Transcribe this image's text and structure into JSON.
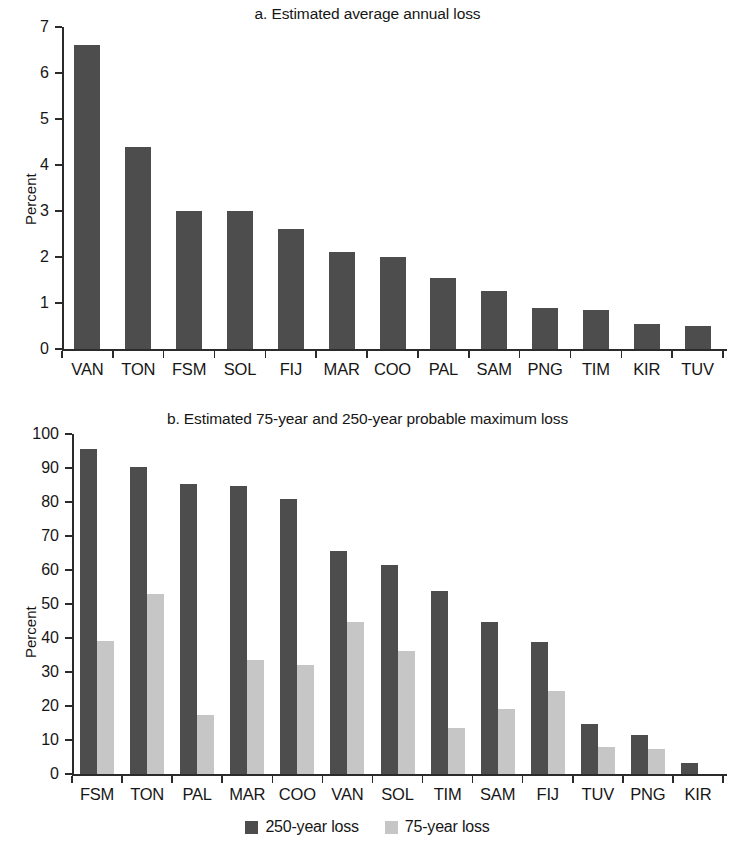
{
  "figure": {
    "ylabel": "Percent",
    "series_colors": {
      "primary": "#4d4d4d",
      "secondary": "#c6c6c6"
    },
    "axis_color": "#2b2b2b"
  },
  "legend": {
    "items": [
      {
        "label": "250-year loss",
        "color": "#4d4d4d"
      },
      {
        "label": "75-year loss",
        "color": "#c6c6c6"
      }
    ]
  },
  "chart_data": [
    {
      "type": "bar",
      "panel": "a",
      "title": "a. Estimated average annual loss",
      "xlabel": "",
      "ylabel": "Percent",
      "ylim": [
        0,
        7
      ],
      "yticks": [
        0,
        1,
        2,
        3,
        4,
        5,
        6,
        7
      ],
      "ytick_labels": [
        "0",
        "1",
        "2",
        "3",
        "4",
        "5",
        "6",
        "7"
      ],
      "grid": false,
      "legend": "none",
      "categories": [
        "VAN",
        "TON",
        "FSM",
        "SOL",
        "FIJ",
        "MAR",
        "COO",
        "PAL",
        "SAM",
        "PNG",
        "TIM",
        "KIR",
        "TUV"
      ],
      "values": [
        6.6,
        4.4,
        3.0,
        3.0,
        2.6,
        2.1,
        2.0,
        1.55,
        1.27,
        0.9,
        0.85,
        0.55,
        0.5
      ]
    },
    {
      "type": "bar",
      "panel": "b",
      "title": "b. Estimated 75-year and 250-year probable maximum loss",
      "xlabel": "",
      "ylabel": "Percent",
      "ylim": [
        0,
        100
      ],
      "yticks": [
        0,
        10,
        20,
        30,
        40,
        50,
        60,
        70,
        80,
        90,
        100
      ],
      "ytick_labels": [
        "0",
        "10",
        "20",
        "30",
        "40",
        "50",
        "60",
        "70",
        "80",
        "90",
        "100"
      ],
      "grid": false,
      "legend": "bottom",
      "categories": [
        "FSM",
        "TON",
        "PAL",
        "MAR",
        "COO",
        "VAN",
        "SOL",
        "TIM",
        "SAM",
        "FIJ",
        "TUV",
        "PNG",
        "KIR"
      ],
      "series": [
        {
          "name": "250-year loss",
          "color": "#4d4d4d",
          "values": [
            95.5,
            90.2,
            85.2,
            84.6,
            80.8,
            65.6,
            61.6,
            53.7,
            44.6,
            38.7,
            14.8,
            11.5,
            3.2
          ]
        },
        {
          "name": "75-year loss",
          "color": "#c6c6c6",
          "values": [
            39.2,
            52.8,
            17.3,
            33.4,
            32.0,
            44.7,
            36.1,
            13.6,
            19.0,
            24.4,
            7.8,
            7.4,
            0
          ]
        }
      ]
    }
  ]
}
